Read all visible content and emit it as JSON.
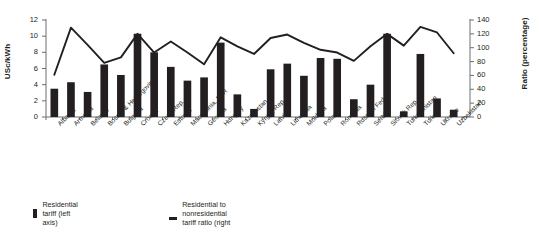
{
  "chart_data": {
    "type": "bar",
    "title": "",
    "xlabel": "",
    "ylabel": "USc/kWh",
    "ylabel_right": "Ratio (percentage)",
    "ylim": [
      0,
      12
    ],
    "ylim_right": [
      0,
      140
    ],
    "yticks": [
      "0",
      "2",
      "4",
      "6",
      "8",
      "10",
      "12"
    ],
    "yticks_right": [
      "0",
      "20",
      "40",
      "60",
      "80",
      "100",
      "120",
      "140"
    ],
    "grid": false,
    "legend_position": "bottom-left",
    "categories": [
      "Albania",
      "Armenia",
      "Belarus",
      "Bosnia & Herzegovina",
      "Bulgaria",
      "Croatia",
      "Czech Rep.",
      "Estonia",
      "Macedonia, FYR",
      "Georgia",
      "Hungary",
      "Kazakhstan",
      "Kyrgyz Rep.",
      "Latvia",
      "Lithuania",
      "Moldova",
      "Poland",
      "Romania",
      "Russian Fed.",
      "Serbia",
      "Slovak Rep.",
      "Turkmenistan",
      "Turkey",
      "Ukraine",
      "Uzbekistan"
    ],
    "series": [
      {
        "name": "Residential tariff (left axis)",
        "axis": "left",
        "type": "bar",
        "color": "#231f20",
        "values": [
          3.5,
          4.3,
          3.1,
          6.5,
          5.2,
          10.3,
          8.0,
          6.2,
          4.5,
          4.9,
          9.2,
          2.8,
          1.0,
          5.9,
          6.6,
          5.1,
          7.3,
          7.2,
          2.2,
          4.0,
          10.3,
          0.7,
          7.8,
          2.3,
          0.9
        ]
      },
      {
        "name": "Residential to nonresidential tariff ratio (right axis)",
        "axis": "right",
        "type": "line",
        "color": "#231f20",
        "values": [
          61,
          129,
          104,
          78,
          86,
          120,
          93,
          109,
          93,
          76,
          115,
          102,
          91,
          114,
          119,
          107,
          97,
          93,
          81,
          102,
          120,
          103,
          130,
          122,
          92
        ]
      }
    ]
  },
  "legend": {
    "bar_label": "Residential tariff (left axis)",
    "line_label": "Residential to nonresidential tariff ratio (right axis)"
  }
}
